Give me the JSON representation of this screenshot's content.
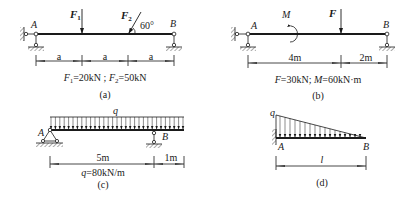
{
  "figures": [
    {
      "id": "a",
      "caption": "(a)",
      "point_labels": [
        "A",
        "B"
      ],
      "forces": [
        {
          "name": "F",
          "sub": "1",
          "direction": "downward",
          "angle_deg": 90
        },
        {
          "name": "F",
          "sub": "2",
          "direction": "inclined",
          "angle_label": "60°"
        }
      ],
      "dimensions": [
        "a",
        "a",
        "a"
      ],
      "given": {
        "f1_name": "F",
        "f1_sub": "1",
        "f1_value": "=20kN",
        "sep": " ; ",
        "f2_name": "F",
        "f2_sub": "2",
        "f2_value": "=50kN"
      },
      "supports": {
        "A": "pinned (wall link + ground link)",
        "B": "roller link"
      }
    },
    {
      "id": "b",
      "caption": "(b)",
      "point_labels": [
        "A",
        "B"
      ],
      "loads": [
        {
          "name": "M",
          "type": "moment",
          "direction": "clockwise"
        },
        {
          "name": "F",
          "type": "force",
          "direction": "downward"
        }
      ],
      "dimensions": [
        "4m",
        "2m"
      ],
      "given": {
        "f_name": "F",
        "f_value": "=30kN",
        "sep": "; ",
        "m_name": "M",
        "m_value": "=60kN·m"
      },
      "supports": {
        "A": "pinned (wall link + ground link)",
        "B": "roller link"
      }
    },
    {
      "id": "c",
      "caption": "(c)",
      "point_labels": [
        "A",
        "B"
      ],
      "loads": [
        {
          "name": "q",
          "type": "uniform distributed load"
        }
      ],
      "dimensions": [
        "5m",
        "1m"
      ],
      "given": {
        "q_name": "q",
        "q_value": "=80kN/m"
      },
      "supports": {
        "A": "pinned triangle",
        "B": "roller link"
      }
    },
    {
      "id": "d",
      "caption": "(d)",
      "point_labels": [
        "A",
        "B"
      ],
      "loads": [
        {
          "name": "q",
          "type": "triangular distributed load (max at A)"
        }
      ],
      "dimensions": [
        "l"
      ],
      "supports": {
        "A": "fixed wall (cantilever)"
      }
    }
  ]
}
